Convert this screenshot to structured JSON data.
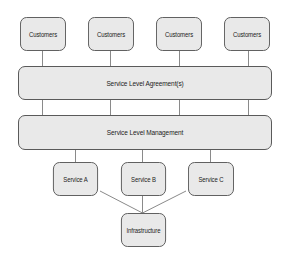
{
  "diagram": {
    "type": "layered-architecture",
    "colors": {
      "node_fill": "#e9e9e9",
      "node_border": "#5a5a5a",
      "line": "#8a8a8a",
      "text": "#222222"
    },
    "customers": [
      {
        "label": "Customers"
      },
      {
        "label": "Customers"
      },
      {
        "label": "Customers"
      },
      {
        "label": "Customers"
      }
    ],
    "sla": {
      "label": "Service Level Agreement(s)"
    },
    "slm": {
      "label": "Service Level Management"
    },
    "services": [
      {
        "label": "Service A"
      },
      {
        "label": "Service B"
      },
      {
        "label": "Service C"
      }
    ],
    "infrastructure": {
      "label": "Infrastructure"
    },
    "edges": [
      [
        "Customers 1",
        "Service Level Agreement(s)"
      ],
      [
        "Customers 2",
        "Service Level Agreement(s)"
      ],
      [
        "Customers 3",
        "Service Level Agreement(s)"
      ],
      [
        "Customers 4",
        "Service Level Agreement(s)"
      ],
      [
        "Service Level Agreement(s)",
        "Service Level Management"
      ],
      [
        "Service Level Management",
        "Service A"
      ],
      [
        "Service Level Management",
        "Service B"
      ],
      [
        "Service Level Management",
        "Service C"
      ],
      [
        "Service A",
        "Infrastructure"
      ],
      [
        "Service B",
        "Infrastructure"
      ],
      [
        "Service C",
        "Infrastructure"
      ]
    ]
  }
}
